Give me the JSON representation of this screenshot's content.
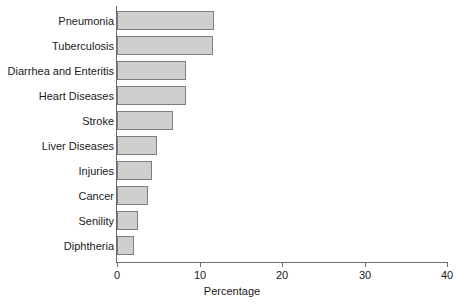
{
  "chart_data": {
    "type": "bar",
    "orientation": "horizontal",
    "title": "",
    "subtitle": "",
    "xlabel": "Percentage",
    "ylabel": "",
    "xlim": [
      0,
      40
    ],
    "xticks": [
      0,
      10,
      20,
      30,
      40
    ],
    "xtick_labels": [
      "0",
      "10",
      "20",
      "30",
      "40"
    ],
    "grid": false,
    "legend": null,
    "categories": [
      "Pneumonia",
      "Tuberculosis",
      "Diarrhea and Enteritis",
      "Heart Diseases",
      "Stroke",
      "Liver Diseases",
      "Injuries",
      "Cancer",
      "Senility",
      "Diphtheria"
    ],
    "values": [
      11.7,
      11.6,
      8.4,
      8.4,
      6.8,
      4.8,
      4.2,
      3.8,
      2.5,
      2.0
    ],
    "bar_color": "#cfcfcf",
    "bar_border_color": "#7d7d7d",
    "axis_color": "#6b6b6b"
  }
}
